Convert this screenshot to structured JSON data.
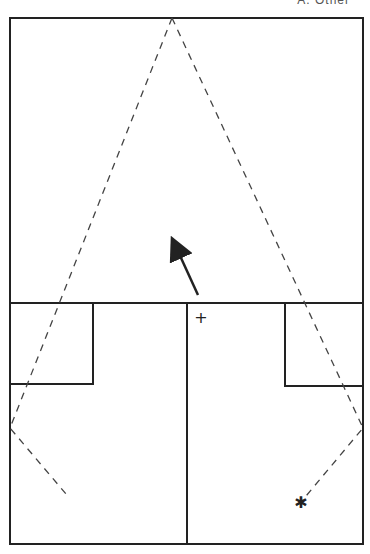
{
  "header": {
    "text": "A. Other"
  },
  "diagram": {
    "stroke_color": "#222222",
    "dash_color": "#444444",
    "outer_box": {
      "x1": 10,
      "y1": 18,
      "x2": 363,
      "y2": 544
    },
    "divider_y": 303,
    "center_line_x": 187,
    "left_box": {
      "x1": 10,
      "y1": 303,
      "x2": 93,
      "y2": 384
    },
    "right_box": {
      "x1": 285,
      "y1": 303,
      "x2": 363,
      "y2": 386
    },
    "apex": {
      "x": 172,
      "y": 18
    },
    "left_path": [
      [
        172,
        18
      ],
      [
        10,
        428
      ],
      [
        66,
        494
      ]
    ],
    "right_path": [
      [
        172,
        18
      ],
      [
        363,
        428
      ],
      [
        301,
        502
      ]
    ],
    "arrow": {
      "from": [
        198,
        295
      ],
      "to": [
        173,
        240
      ]
    },
    "plus_marker": {
      "x": 201,
      "y": 318,
      "symbol": "+"
    },
    "star_marker": {
      "x": 301,
      "y": 502,
      "symbol": "✱"
    }
  }
}
